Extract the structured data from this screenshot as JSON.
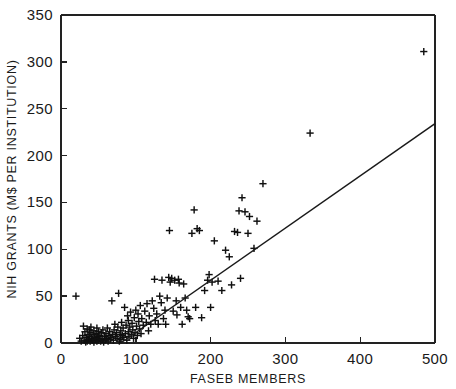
{
  "chart_data": {
    "type": "scatter",
    "title": "",
    "xlabel": "FASEB MEMBERS",
    "ylabel": "NIH GRANTS (M$ PER INSTITUTION)",
    "xlim": [
      0,
      500
    ],
    "ylim": [
      0,
      350
    ],
    "xticks": [
      0,
      100,
      200,
      300,
      400,
      500
    ],
    "yticks": [
      0,
      50,
      100,
      150,
      200,
      250,
      300,
      350
    ],
    "xtick_labels": [
      "0",
      "100",
      "200",
      "300",
      "400",
      "500"
    ],
    "ytick_labels": [
      "0",
      "50",
      "100",
      "150",
      "200",
      "250",
      "300",
      "350"
    ],
    "grid": false,
    "legend": false,
    "marker_symbol": "plus",
    "marker_color": "#101010",
    "series": [
      {
        "name": "institutions",
        "marker": "+",
        "points": [
          [
            20,
            50
          ],
          [
            25,
            5
          ],
          [
            27,
            2
          ],
          [
            29,
            8
          ],
          [
            30,
            18
          ],
          [
            31,
            3
          ],
          [
            32,
            12
          ],
          [
            33,
            1
          ],
          [
            34,
            6
          ],
          [
            35,
            15
          ],
          [
            35,
            2
          ],
          [
            36,
            9
          ],
          [
            37,
            4
          ],
          [
            38,
            14
          ],
          [
            38,
            7
          ],
          [
            39,
            2
          ],
          [
            40,
            11
          ],
          [
            40,
            17
          ],
          [
            41,
            5
          ],
          [
            42,
            3
          ],
          [
            43,
            9
          ],
          [
            44,
            13
          ],
          [
            44,
            1
          ],
          [
            45,
            6
          ],
          [
            46,
            4
          ],
          [
            47,
            10
          ],
          [
            48,
            2
          ],
          [
            48,
            16
          ],
          [
            49,
            7
          ],
          [
            50,
            3
          ],
          [
            50,
            12
          ],
          [
            51,
            5
          ],
          [
            52,
            8
          ],
          [
            53,
            2
          ],
          [
            54,
            11
          ],
          [
            55,
            4
          ],
          [
            56,
            14
          ],
          [
            57,
            1
          ],
          [
            58,
            7
          ],
          [
            59,
            3
          ],
          [
            60,
            10
          ],
          [
            61,
            5
          ],
          [
            62,
            16
          ],
          [
            63,
            2
          ],
          [
            64,
            8
          ],
          [
            65,
            12
          ],
          [
            66,
            4
          ],
          [
            67,
            6
          ],
          [
            68,
            45
          ],
          [
            69,
            9
          ],
          [
            70,
            3
          ],
          [
            71,
            14
          ],
          [
            72,
            20
          ],
          [
            73,
            7
          ],
          [
            74,
            11
          ],
          [
            75,
            5
          ],
          [
            76,
            17
          ],
          [
            77,
            53
          ],
          [
            78,
            2
          ],
          [
            79,
            9
          ],
          [
            80,
            13
          ],
          [
            80,
            4
          ],
          [
            81,
            22
          ],
          [
            82,
            8
          ],
          [
            83,
            16
          ],
          [
            84,
            6
          ],
          [
            85,
            38
          ],
          [
            86,
            10
          ],
          [
            87,
            19
          ],
          [
            88,
            3
          ],
          [
            89,
            29
          ],
          [
            90,
            12
          ],
          [
            90,
            24
          ],
          [
            91,
            7
          ],
          [
            92,
            17
          ],
          [
            93,
            33
          ],
          [
            94,
            9
          ],
          [
            95,
            21
          ],
          [
            96,
            14
          ],
          [
            97,
            5
          ],
          [
            98,
            27
          ],
          [
            99,
            11
          ],
          [
            100,
            35
          ],
          [
            101,
            18
          ],
          [
            102,
            8
          ],
          [
            103,
            31
          ],
          [
            104,
            23
          ],
          [
            105,
            15
          ],
          [
            106,
            40
          ],
          [
            107,
            10
          ],
          [
            108,
            26
          ],
          [
            110,
            19
          ],
          [
            112,
            34
          ],
          [
            114,
            22
          ],
          [
            115,
            42
          ],
          [
            117,
            13
          ],
          [
            118,
            29
          ],
          [
            120,
            20
          ],
          [
            122,
            45
          ],
          [
            124,
            37
          ],
          [
            125,
            68
          ],
          [
            126,
            24
          ],
          [
            128,
            31
          ],
          [
            130,
            20
          ],
          [
            132,
            50
          ],
          [
            134,
            43
          ],
          [
            135,
            67
          ],
          [
            137,
            26
          ],
          [
            139,
            35
          ],
          [
            140,
            20
          ],
          [
            142,
            48
          ],
          [
            144,
            70
          ],
          [
            145,
            120
          ],
          [
            146,
            65
          ],
          [
            148,
            69
          ],
          [
            150,
            34
          ],
          [
            152,
            67
          ],
          [
            154,
            45
          ],
          [
            155,
            30
          ],
          [
            157,
            68
          ],
          [
            158,
            64
          ],
          [
            160,
            38
          ],
          [
            162,
            20
          ],
          [
            164,
            63
          ],
          [
            166,
            48
          ],
          [
            168,
            35
          ],
          [
            170,
            28
          ],
          [
            172,
            26
          ],
          [
            175,
            117
          ],
          [
            178,
            142
          ],
          [
            180,
            38
          ],
          [
            182,
            122
          ],
          [
            185,
            120
          ],
          [
            188,
            27
          ],
          [
            192,
            56
          ],
          [
            196,
            67
          ],
          [
            198,
            73
          ],
          [
            200,
            38
          ],
          [
            202,
            65
          ],
          [
            205,
            109
          ],
          [
            210,
            66
          ],
          [
            215,
            56
          ],
          [
            220,
            99
          ],
          [
            225,
            92
          ],
          [
            228,
            62
          ],
          [
            232,
            119
          ],
          [
            236,
            118
          ],
          [
            238,
            141
          ],
          [
            240,
            69
          ],
          [
            242,
            155
          ],
          [
            246,
            140
          ],
          [
            250,
            117
          ],
          [
            252,
            135
          ],
          [
            258,
            101
          ],
          [
            262,
            130
          ],
          [
            270,
            170
          ],
          [
            333,
            224
          ],
          [
            485,
            311
          ]
        ]
      }
    ],
    "fit_line": {
      "name": "regression line",
      "x_start": 80,
      "y_start": 0,
      "x_end": 500,
      "y_end": 234
    }
  }
}
